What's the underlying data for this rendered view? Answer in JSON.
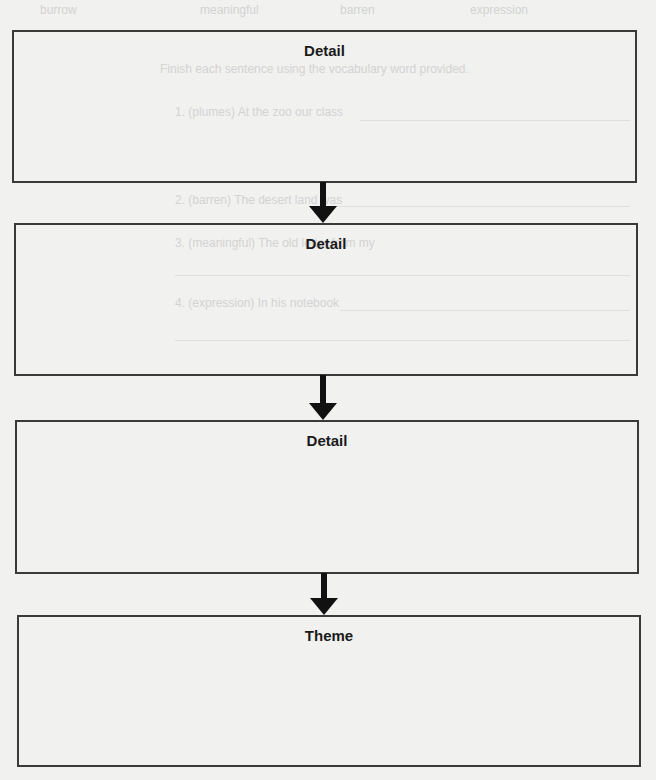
{
  "bleed_through_text": {
    "header_words": [
      "burrow",
      "meaningful",
      "barren",
      "expression"
    ],
    "instruction": "Finish each sentence using the vocabulary word provided.",
    "items": [
      "1. (plumes) At the zoo our class",
      "2. (barren) The desert land was",
      "3. (meaningful) The old letter from my",
      "4. (expression) In his notebook"
    ]
  },
  "organizer": {
    "boxes": [
      {
        "title": "Detail"
      },
      {
        "title": "Detail"
      },
      {
        "title": "Detail"
      },
      {
        "title": "Theme"
      }
    ],
    "arrow_icon": "down-arrow-icon",
    "colors": {
      "border": "#3a3a3a",
      "arrow": "#111111",
      "paper": "#f1f1f0"
    }
  }
}
